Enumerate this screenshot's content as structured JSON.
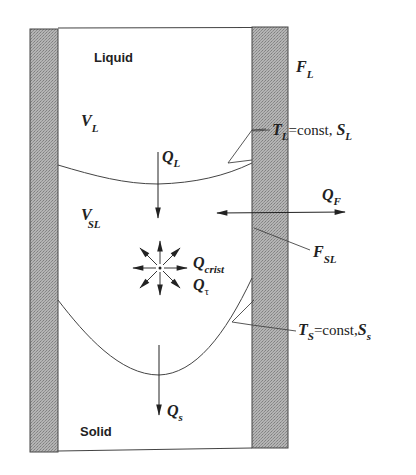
{
  "regions": {
    "liquid": "Liquid",
    "solid": "Solid"
  },
  "volumes": {
    "v_liquid": {
      "main": "V",
      "sub": "L"
    },
    "v_solid_liquid": {
      "main": "V",
      "sub": "SL"
    }
  },
  "heat_flows": {
    "q_liquid": {
      "main": "Q",
      "sub": "L"
    },
    "q_solid": {
      "main": "Q",
      "sub": "s"
    },
    "q_wall": {
      "main": "Q",
      "sub": "F"
    },
    "q_crist": {
      "main": "Q",
      "sub": "crist"
    },
    "q_tau": {
      "main": "Q",
      "sub": "τ"
    }
  },
  "surfaces": {
    "f_liquid": {
      "main": "F",
      "sub": "L"
    },
    "f_solid_liquid": {
      "main": "F",
      "sub": "SL"
    }
  },
  "isotherms": {
    "liquidus": {
      "t_main": "T",
      "t_sub": "L",
      "eq": "=const,",
      "s_main": "S",
      "s_sub": "L"
    },
    "solidus": {
      "t_main": "T",
      "t_sub": "S",
      "eq": "=const,",
      "s_main": "S",
      "s_sub": "s"
    }
  },
  "colors": {
    "wall_fill": "#a8a8a8",
    "line": "#333333",
    "text": "#222222"
  }
}
